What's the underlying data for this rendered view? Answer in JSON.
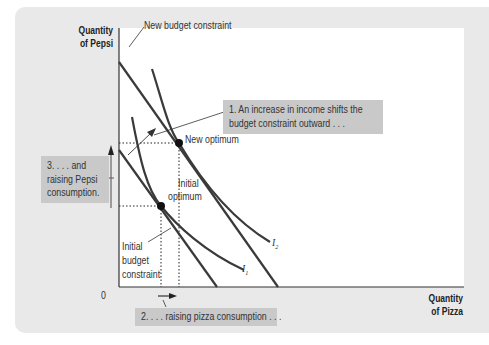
{
  "diagram": {
    "title": "",
    "y_axis_label_line1": "Quantity",
    "y_axis_label_line2": "of Pepsi",
    "x_axis_label_line1": "Quantity",
    "x_axis_label_line2": "of Pizza",
    "origin_label": "0",
    "new_budget_constraint_label": "New budget constraint",
    "new_optimum_label": "New optimum",
    "initial_optimum_line1": "Initial",
    "initial_optimum_line2": "optimum",
    "initial_budget_line1": "Initial",
    "initial_budget_line2": "budget",
    "initial_budget_line3": "constraint",
    "curve_i1_label": "I",
    "curve_i1_sub": "1",
    "curve_i2_label": "I",
    "curve_i2_sub": "2",
    "callout_1_line1": "1. An increase in income shifts the",
    "callout_1_line2": "budget constraint outward . . .",
    "callout_2": "2. . . . raising pizza consumption . . .",
    "callout_3_line1": "3. . . . and",
    "callout_3_line2": "raising Pepsi",
    "callout_3_line3": "consumption.",
    "colors": {
      "curve": "#3a3a3a",
      "panel_bg": "#e9e9e9",
      "callout_bg": "#c9c9c9",
      "plot_bg": "#ffffff"
    }
  }
}
